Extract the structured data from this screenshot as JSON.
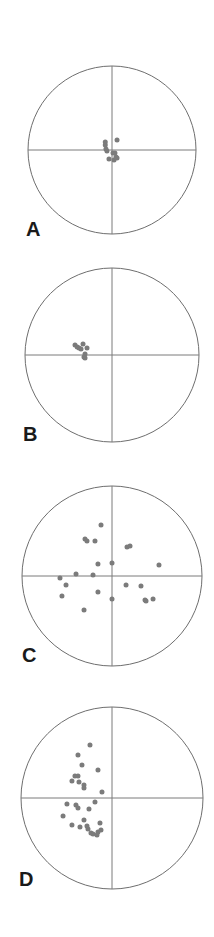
{
  "figure": {
    "title": "",
    "background_color": "#ffffff",
    "point_color": "#7b7b7b",
    "line_color": "#6e6e6e",
    "label_color": "#1a1a1a",
    "width": 214,
    "height": 937
  },
  "panels": [
    {
      "id": "A",
      "label": "A",
      "label_x": 26,
      "label_y": 219
    },
    {
      "id": "B",
      "label": "B",
      "label_y": 424,
      "label_x": 23
    },
    {
      "id": "C",
      "label": "C",
      "label_x": 22,
      "label_y": 645
    },
    {
      "id": "D",
      "label": "D",
      "label_x": 19,
      "label_y": 869
    }
  ],
  "chart_data": [
    {
      "type": "scatter",
      "title": "A",
      "subtitle": "",
      "projection": "equal-area stereonet (lower hemisphere)",
      "xlabel": "",
      "ylabel": "",
      "xlim": [
        -1,
        1
      ],
      "ylim": [
        -1,
        1
      ],
      "grid": false,
      "legend": null,
      "axes": [
        "horizontal diameter",
        "vertical diameter"
      ],
      "center": {
        "cx": 112,
        "cy": 150
      },
      "radius": 84,
      "n_points": 11,
      "points_normalized": [
        [
          -0.08,
          0.095
        ],
        [
          -0.08,
          0.06
        ],
        [
          -0.072,
          0.012
        ],
        [
          -0.06,
          -0.012
        ],
        [
          0.06,
          0.12
        ],
        [
          0.012,
          -0.035
        ],
        [
          0.035,
          -0.035
        ],
        [
          -0.036,
          -0.107
        ],
        [
          0.024,
          -0.119
        ],
        [
          0.06,
          -0.095
        ],
        [
          0.048,
          -0.083
        ]
      ]
    },
    {
      "type": "scatter",
      "title": "B",
      "subtitle": "",
      "projection": "equal-area stereonet (lower hemisphere)",
      "xlabel": "",
      "ylabel": "",
      "xlim": [
        -1,
        1
      ],
      "ylim": [
        -1,
        1
      ],
      "grid": false,
      "legend": null,
      "axes": [
        "horizontal diameter",
        "vertical diameter"
      ],
      "center": {
        "cx": 112,
        "cy": 355
      },
      "radius": 87,
      "n_points": 9,
      "points_normalized": [
        [
          -0.425,
          0.115
        ],
        [
          -0.4,
          0.092
        ],
        [
          -0.379,
          0.08
        ],
        [
          -0.356,
          0.069
        ],
        [
          -0.333,
          0.126
        ],
        [
          -0.287,
          0.08
        ],
        [
          -0.31,
          0.011
        ],
        [
          -0.322,
          -0.023
        ],
        [
          -0.31,
          -0.034
        ]
      ]
    },
    {
      "type": "scatter",
      "title": "C",
      "subtitle": "",
      "projection": "equal-area stereonet (lower hemisphere)",
      "xlabel": "",
      "ylabel": "",
      "xlim": [
        -1,
        1
      ],
      "ylim": [
        -1,
        1
      ],
      "grid": false,
      "legend": null,
      "axes": [
        "horizontal diameter",
        "vertical diameter"
      ],
      "center": {
        "cx": 112,
        "cy": 576
      },
      "radius": 90,
      "n_points": 22,
      "points_normalized": [
        [
          -0.122,
          0.567
        ],
        [
          -0.3,
          0.411
        ],
        [
          -0.278,
          0.389
        ],
        [
          -0.189,
          0.389
        ],
        [
          0.167,
          0.322
        ],
        [
          0.2,
          0.333
        ],
        [
          -0.156,
          0.133
        ],
        [
          0.0,
          0.144
        ],
        [
          0.522,
          0.122
        ],
        [
          -0.4,
          0.022
        ],
        [
          -0.578,
          -0.022
        ],
        [
          -0.211,
          0.011
        ],
        [
          -0.511,
          -0.1
        ],
        [
          0.156,
          -0.1
        ],
        [
          0.322,
          -0.111
        ],
        [
          -0.156,
          -0.178
        ],
        [
          -0.556,
          -0.222
        ],
        [
          0.0,
          -0.256
        ],
        [
          0.456,
          -0.256
        ],
        [
          0.367,
          -0.267
        ],
        [
          0.378,
          -0.278
        ],
        [
          -0.311,
          -0.378
        ]
      ]
    },
    {
      "type": "scatter",
      "title": "D",
      "subtitle": "",
      "projection": "equal-area stereonet (lower hemisphere)",
      "xlabel": "",
      "ylabel": "",
      "xlim": [
        -1,
        1
      ],
      "ylim": [
        -1,
        1
      ],
      "grid": false,
      "legend": null,
      "axes": [
        "horizontal diameter",
        "vertical diameter"
      ],
      "center": {
        "cx": 112,
        "cy": 798
      },
      "radius": 91,
      "n_points": 28,
      "points_normalized": [
        [
          -0.242,
          0.582
        ],
        [
          -0.374,
          0.473
        ],
        [
          -0.33,
          0.363
        ],
        [
          -0.154,
          0.308
        ],
        [
          -0.407,
          0.242
        ],
        [
          -0.374,
          0.242
        ],
        [
          -0.44,
          0.187
        ],
        [
          -0.363,
          0.176
        ],
        [
          -0.308,
          0.143
        ],
        [
          -0.308,
          0.11
        ],
        [
          -0.11,
          0.066
        ],
        [
          -0.495,
          -0.066
        ],
        [
          -0.396,
          -0.077
        ],
        [
          -0.374,
          -0.11
        ],
        [
          -0.187,
          -0.044
        ],
        [
          -0.253,
          -0.121
        ],
        [
          -0.538,
          -0.198
        ],
        [
          -0.308,
          -0.242
        ],
        [
          -0.44,
          -0.297
        ],
        [
          -0.352,
          -0.319
        ],
        [
          -0.132,
          -0.275
        ],
        [
          -0.264,
          -0.341
        ],
        [
          -0.231,
          -0.385
        ],
        [
          -0.209,
          -0.396
        ],
        [
          -0.154,
          -0.374
        ],
        [
          -0.165,
          -0.407
        ],
        [
          -0.121,
          -0.352
        ],
        [
          -0.275,
          -0.308
        ]
      ]
    }
  ]
}
